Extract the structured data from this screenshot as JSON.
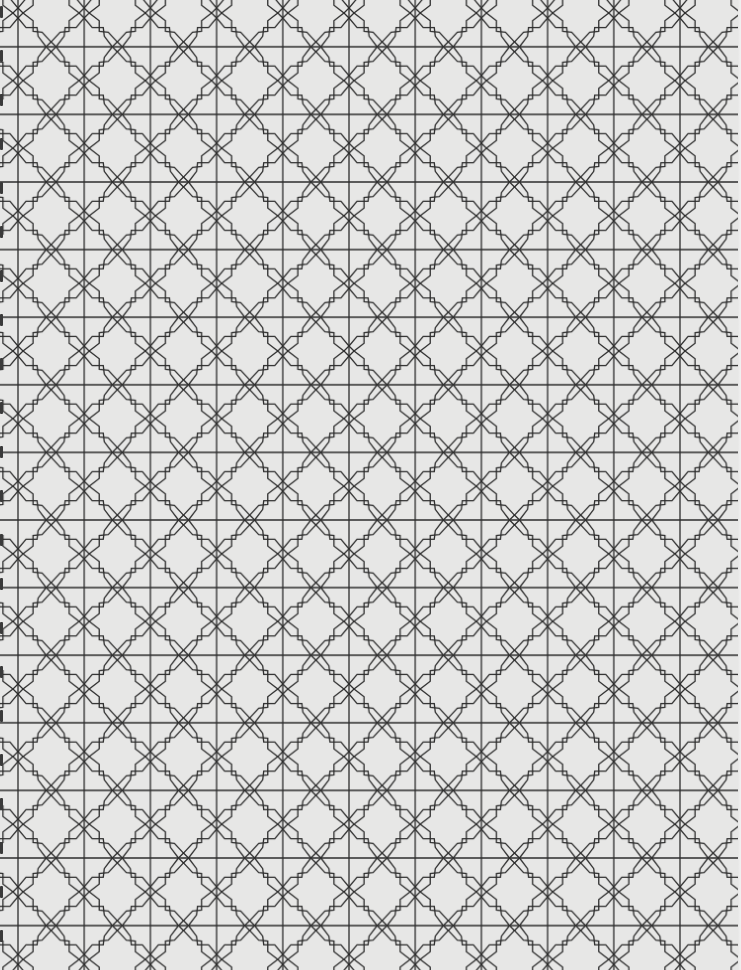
{
  "image": {
    "description": "Scanned page of an interlocking geometric lattice pattern: stepped eight-point star/cross shapes linked by small diamonds, with continuous vertical and horizontal lines",
    "background_color": "#e7e7e6",
    "line_color": "#2b2b2b",
    "binding_mark_color": "#3a3a3a"
  },
  "pattern": {
    "tile_width": 66.2,
    "tile_height": 67.6,
    "offset_x": 18,
    "offset_y": 13,
    "diamond_half_size": 5,
    "stroke_width": 1.3
  },
  "binding_marks": {
    "count": 22,
    "start_y": 6,
    "spacing": 44
  }
}
